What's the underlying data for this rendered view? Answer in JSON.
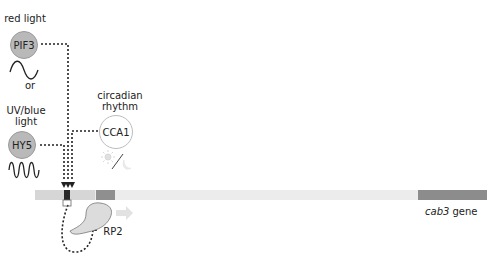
{
  "labels": {
    "red_light": "red light",
    "or": "or",
    "uv_blue_light_line1": "UV/blue",
    "uv_blue_light_line2": "light",
    "circadian_line1": "circadian",
    "circadian_line2": "rhythm",
    "gene_name": "cab3",
    "gene_suffix": " gene"
  },
  "nodes": {
    "pif3": "PIF3",
    "hy5": "HY5",
    "cca1": "CCA1",
    "rp2": "RP2"
  },
  "colors": {
    "grey_circle": "#b9b9b9",
    "gene_bar": "#ececec",
    "promoter_light": "#d4d4d4",
    "box_dark": "#8f8f8f",
    "coding_region": "#8c8c8c",
    "rp2_fill": "#dcdcdc"
  }
}
